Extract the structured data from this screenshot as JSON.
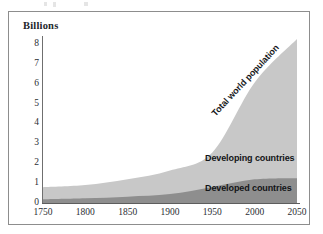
{
  "figure": {
    "axis_title": "Billions"
  },
  "chart_data": {
    "type": "area",
    "title": "Billions",
    "xlabel": "",
    "ylabel": "Billions",
    "stacked": true,
    "grid": false,
    "legend_position": "inline-annotations",
    "xlim": [
      1750,
      2050
    ],
    "ylim": [
      0,
      8.4
    ],
    "x_ticks": [
      1750,
      1800,
      1850,
      1900,
      1950,
      2000,
      2050
    ],
    "y_ticks": [
      0,
      1,
      2,
      3,
      4,
      5,
      6,
      7,
      8
    ],
    "x": [
      1750,
      1800,
      1850,
      1900,
      1950,
      2000,
      2050
    ],
    "series": [
      {
        "name": "Developed countries",
        "color": "#8e8e8e",
        "values": [
          0.19,
          0.24,
          0.32,
          0.45,
          0.81,
          1.19,
          1.25
        ]
      },
      {
        "name": "Developing countries",
        "color": "#c8c8c8",
        "values": [
          0.6,
          0.66,
          0.87,
          1.18,
          1.73,
          4.87,
          7.0
        ]
      }
    ],
    "total": {
      "name": "Total world population",
      "values": [
        0.79,
        0.9,
        1.19,
        1.63,
        2.54,
        6.06,
        8.25
      ]
    },
    "annotations": [
      {
        "text": "Total world population",
        "rotation": -47
      },
      {
        "text": "Developing countries",
        "rotation": 0
      },
      {
        "text": "Developed countries",
        "rotation": 0
      }
    ]
  },
  "colors": {
    "developed": "#8e8e8e",
    "developing": "#c8c8c8",
    "frame": "#8d8d8d",
    "axis": "#5d5d5d",
    "text": "#2b2e33"
  }
}
